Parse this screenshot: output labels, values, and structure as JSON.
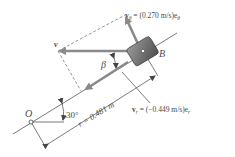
{
  "figure": {
    "point_o_label": "O",
    "point_b_label": "B",
    "velocity_label": "v",
    "beta_label": "β",
    "angle_label": "30°",
    "radius_label": "r = 0.481 m",
    "v_theta_label": "v",
    "v_theta_sub": "θ",
    "v_theta_value": " = (0.270 m/s)e",
    "v_theta_unit_sub": "θ",
    "v_r_label": "v",
    "v_r_sub": "r",
    "v_r_value": " = (−0.449 m/s)e",
    "v_r_unit_sub": "r"
  },
  "colors": {
    "arrow": "#8a8a8a",
    "line": "#555555",
    "block_dark": "#5a5a5a",
    "block_light": "#9a9a9a"
  }
}
